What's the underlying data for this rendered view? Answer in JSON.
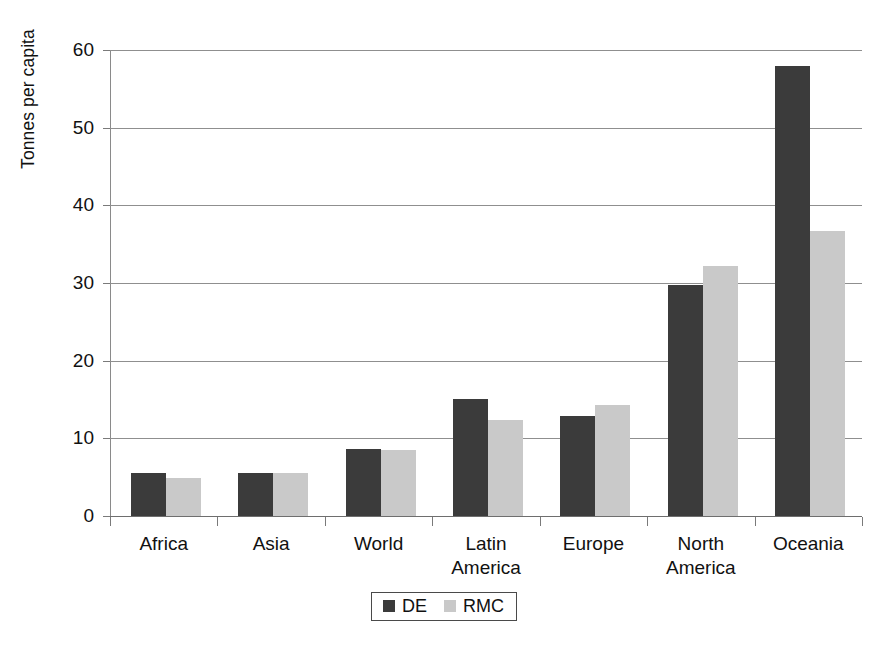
{
  "chart_data": {
    "type": "bar",
    "title": "",
    "subtitle": "",
    "xlabel": "",
    "ylabel": "Tonnes per capita",
    "ylim": [
      0,
      60
    ],
    "yticks": [
      0,
      10,
      20,
      30,
      40,
      50,
      60
    ],
    "ytick_labels": [
      "0",
      "10",
      "20",
      "30",
      "40",
      "50",
      "60"
    ],
    "grid": true,
    "legend_position": "bottom-center",
    "categories": [
      "Africa",
      "Asia",
      "World",
      "Latin\nAmerica",
      "Europe",
      "North\nAmerica",
      "Oceania"
    ],
    "category_lines": [
      [
        "Africa"
      ],
      [
        "Asia"
      ],
      [
        "World"
      ],
      [
        "Latin",
        "America"
      ],
      [
        "Europe"
      ],
      [
        "North",
        "America"
      ],
      [
        "Oceania"
      ]
    ],
    "series": [
      {
        "name": "DE",
        "color": "#3b3b3b",
        "values": [
          5.6,
          5.5,
          8.6,
          15.1,
          12.9,
          29.8,
          58.0
        ]
      },
      {
        "name": "RMC",
        "color": "#c9c9c9",
        "values": [
          4.9,
          5.5,
          8.5,
          12.4,
          14.3,
          32.2,
          36.7
        ]
      }
    ],
    "legend": [
      {
        "label": "DE",
        "color": "#3b3b3b"
      },
      {
        "label": "RMC",
        "color": "#c9c9c9"
      }
    ]
  },
  "caption": {
    "text": ""
  },
  "colors": {
    "de": "#3b3b3b",
    "rmc": "#c9c9c9",
    "grid": "#8f8f8f",
    "axis": "#7a7a7a",
    "text": "#111111",
    "background": "#ffffff"
  }
}
